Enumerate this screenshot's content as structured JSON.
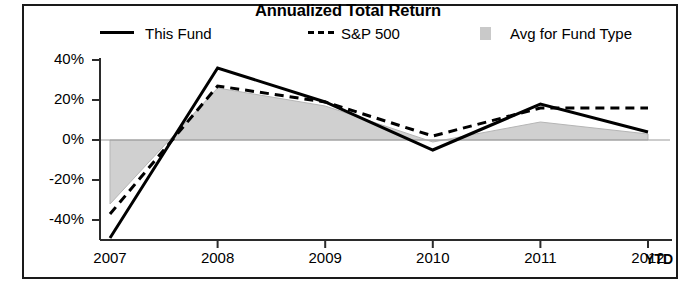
{
  "chart_data": {
    "type": "line",
    "title": "Annualized Total Return",
    "xlabel": "",
    "ylabel": "",
    "categories": [
      "2007",
      "2008",
      "2009",
      "2010",
      "2011",
      "2012"
    ],
    "x_tick_labels": [
      "2007",
      "2008",
      "2009",
      "2010",
      "2011",
      "2012"
    ],
    "x_axis_suffix": "YTD",
    "y_tick_labels": [
      "40%",
      "20%",
      "0%",
      "-20%",
      "-40%"
    ],
    "y_tick_values": [
      40,
      20,
      0,
      -20,
      -40
    ],
    "ylim": [
      -50,
      44
    ],
    "grid": false,
    "legend_position": "top",
    "series": [
      {
        "name": "This Fund",
        "style": "solid",
        "color": "#000000",
        "values": [
          -49,
          36,
          19,
          -5,
          18,
          4
        ]
      },
      {
        "name": "S&P 500",
        "style": "dashed",
        "color": "#000000",
        "values": [
          -37,
          27,
          19,
          2,
          16,
          16
        ]
      },
      {
        "name": "Avg for Fund Type",
        "style": "area",
        "color": "#c9c9c9",
        "values": [
          -32,
          26,
          17,
          -1,
          9,
          3
        ]
      }
    ]
  },
  "chart": {
    "title": "Annualized Total Return",
    "ytd_suffix": "YTD"
  },
  "legend": {
    "items": [
      {
        "label": "This Fund",
        "swatch": "solid-line-swatch"
      },
      {
        "label": "S&P 500",
        "swatch": "dashed-line-swatch"
      },
      {
        "label": "Avg for Fund Type",
        "swatch": "gray-area-swatch"
      }
    ]
  },
  "axes": {
    "y_ticks": [
      "40%",
      "20%",
      "0%",
      "-20%",
      "-40%"
    ],
    "x_ticks": [
      "2007",
      "2008",
      "2009",
      "2010",
      "2011",
      "2012"
    ]
  }
}
